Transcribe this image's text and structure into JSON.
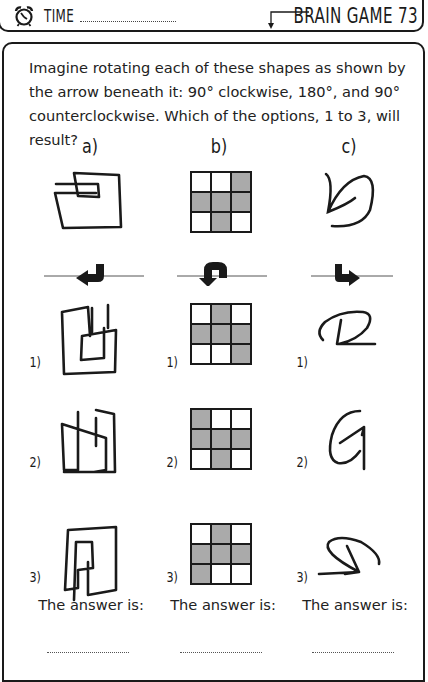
{
  "header": {
    "time_label": "TIME",
    "title": "BRAIN GAME 73",
    "icons": [
      "alarm-clock-icon",
      "down-arrow-icon"
    ]
  },
  "instructions": "Imagine rotating each of these shapes as shown by the arrow beneath it: 90° clockwise, 180°, and 90° counterclockwise. Which of the options, 1 to 3, will result?",
  "columns": [
    {
      "label": "a)",
      "rotation": "90° clockwise",
      "arrow_icon": "rotate-left-arrow-icon",
      "options": [
        "1)",
        "2)",
        "3)"
      ],
      "answer_label": "The answer is:"
    },
    {
      "label": "b)",
      "rotation": "180°",
      "arrow_icon": "u-turn-arrow-icon",
      "grid": [
        [
          0,
          0,
          1
        ],
        [
          1,
          1,
          1
        ],
        [
          0,
          1,
          0
        ]
      ],
      "option_grids": [
        [
          [
            0,
            1,
            0
          ],
          [
            1,
            1,
            1
          ],
          [
            0,
            0,
            1
          ]
        ],
        [
          [
            1,
            0,
            0
          ],
          [
            1,
            1,
            1
          ],
          [
            0,
            1,
            0
          ]
        ],
        [
          [
            0,
            1,
            0
          ],
          [
            1,
            1,
            1
          ],
          [
            1,
            0,
            0
          ]
        ]
      ],
      "options": [
        "1)",
        "2)",
        "3)"
      ],
      "answer_label": "The answer is:"
    },
    {
      "label": "c)",
      "rotation": "90° counterclockwise",
      "arrow_icon": "turn-right-arrow-icon",
      "options": [
        "1)",
        "2)",
        "3)"
      ],
      "answer_label": "The answer is:"
    }
  ],
  "colors": {
    "ink": "#1a1a1a",
    "cell_fill": "#aaaaaa"
  }
}
